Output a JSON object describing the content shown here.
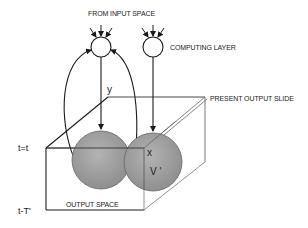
{
  "diagram": {
    "labels": {
      "input_space": "FROM INPUT SPACE",
      "computing_layer": "COMPUTING LAYER",
      "present_output_slide": "PRESENT OUTPUT SLIDE",
      "output_space": "OUTPUT SPACE",
      "var_y": "y",
      "var_x": "x",
      "var_v": "V '",
      "time_now": "t=t",
      "time_past": "t-T'"
    },
    "nodes": [
      {
        "id": "neuron-1",
        "role": "computing unit receiving input space and feedback"
      },
      {
        "id": "neuron-2",
        "role": "computing unit in computing layer"
      }
    ],
    "colors": {
      "line": "#1a1a1a",
      "sphere_fill": "#9a9a9a",
      "sphere_stroke": "#555555",
      "box_line": "#333333",
      "slide_line": "#666666"
    }
  }
}
